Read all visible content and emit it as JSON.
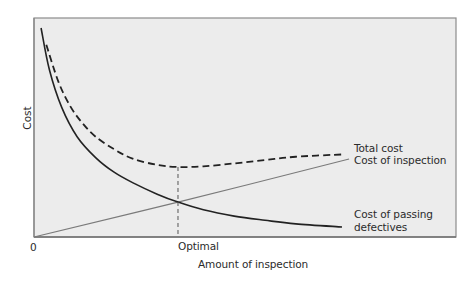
{
  "chart_data": {
    "type": "line",
    "title": "",
    "xlabel": "Amount of inspection",
    "ylabel": "Cost",
    "x_tick_labels": [
      "0",
      "Optimal"
    ],
    "xlim": [
      0,
      105
    ],
    "ylim": [
      0,
      110
    ],
    "grid": false,
    "legend": "direct labels at right end of each curve",
    "optimal_x": 46.75,
    "series": [
      {
        "name": "Total cost",
        "style": "dashed",
        "color": "#222222",
        "x": [
          4.0,
          8,
          12,
          16,
          20,
          26,
          32,
          40,
          46.75,
          55,
          65,
          75,
          85,
          100
        ],
        "y": [
          92.0,
          74,
          62,
          54,
          48,
          42,
          37.5,
          34.5,
          33.5,
          33.8,
          35.2,
          36.8,
          38.4,
          39.5
        ]
      },
      {
        "name": "Cost of inspection",
        "style": "solid-thin",
        "color": "#7a7a7a",
        "x": [
          0,
          46.75,
          102.3
        ],
        "y": [
          0,
          16.7,
          37.3
        ]
      },
      {
        "name": "Cost of passing defectives",
        "style": "solid",
        "color": "#222222",
        "x": [
          2.3,
          5,
          9,
          14,
          20,
          26,
          32,
          40,
          46.75,
          55,
          65,
          75,
          85,
          100
        ],
        "y": [
          100,
          80,
          62,
          48,
          38,
          31,
          26,
          20.5,
          16.7,
          13,
          10,
          8,
          6.3,
          4.8
        ]
      }
    ],
    "annotations": [
      {
        "text": "Optimal",
        "x": 46.75,
        "type": "vertical dashed drop line from total-cost minimum to x-axis"
      }
    ]
  },
  "labels": {
    "y_axis": "Cost",
    "x_axis": "Amount of inspection",
    "origin": "0",
    "optimal": "Optimal",
    "total_cost": "Total cost",
    "cost_of_inspection": "Cost of inspection",
    "cost_of_passing_line1": "Cost of passing",
    "cost_of_passing_line2": "defectives"
  },
  "colors": {
    "plot_background": "#ececec",
    "frame": "#8c8c8c",
    "curve_dark": "#222222",
    "inspection_line": "#7a7a7a"
  }
}
